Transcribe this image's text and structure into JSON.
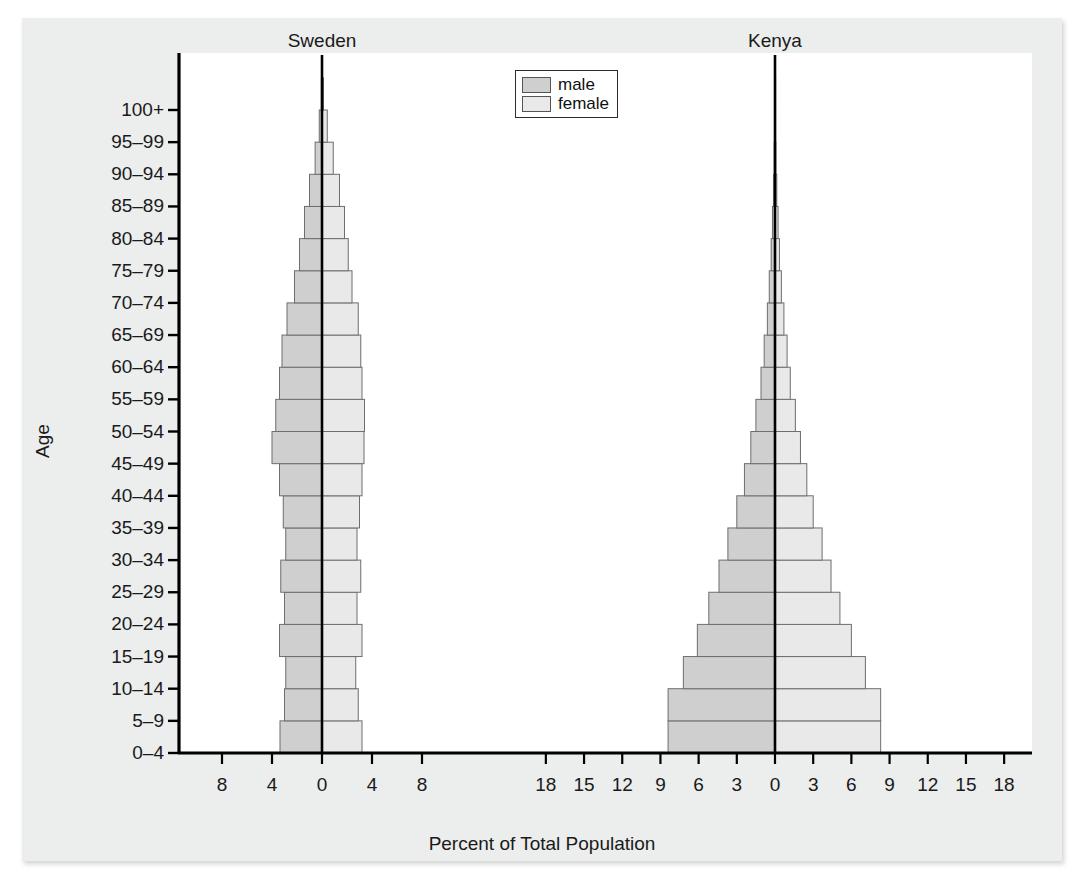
{
  "figure": {
    "background": "#eceded",
    "plot_background": "#ffffff"
  },
  "titles": {
    "left_panel": "Sweden",
    "right_panel": "Kenya"
  },
  "axes": {
    "y_title": "Age",
    "x_title": "Percent of Total Population",
    "y_tick_labels": [
      "0–4",
      "5–9",
      "10–14",
      "15–19",
      "20–24",
      "25–29",
      "30–34",
      "35–39",
      "40–44",
      "45–49",
      "50–54",
      "55–59",
      "60–64",
      "65–69",
      "70–74",
      "75–79",
      "80–84",
      "85–89",
      "90–94",
      "95–99",
      "100+"
    ],
    "sweden_x_ticks": [
      "8",
      "4",
      "0",
      "4",
      "8"
    ],
    "kenya_x_ticks": [
      "18",
      "15",
      "12",
      "9",
      "6",
      "3",
      "0",
      "3",
      "6",
      "9",
      "12",
      "15",
      "18"
    ]
  },
  "legend": {
    "position": "top-center",
    "items": [
      {
        "label": "male",
        "color": "#cfcfcf"
      },
      {
        "label": "female",
        "color": "#e9e9e9"
      }
    ]
  },
  "colors": {
    "male_fill": "#cfcfcf",
    "female_fill": "#e9e9e9",
    "bar_stroke": "#6e6e6e",
    "axis": "#000000",
    "text": "#1a1a1a"
  },
  "chart_data": {
    "type": "bar",
    "subtype": "population-pyramid",
    "title": "Percent of Total Population",
    "xlabel": "Percent of Total Population",
    "ylabel": "Age",
    "grid": false,
    "legend": [
      "male",
      "female"
    ],
    "categories": [
      "0–4",
      "5–9",
      "10–14",
      "15–19",
      "20–24",
      "25–29",
      "30–34",
      "35–39",
      "40–44",
      "45–49",
      "50–54",
      "55–59",
      "60–64",
      "65–69",
      "70–74",
      "75–79",
      "80–84",
      "85–89",
      "90–94",
      "95–99",
      "100+"
    ],
    "panels": [
      {
        "name": "Sweden",
        "xlim": [
          -10,
          10
        ],
        "xticks": [
          -8,
          -4,
          0,
          4,
          8
        ],
        "series": [
          {
            "name": "male",
            "values": [
              3.36,
              3.0,
              2.9,
              3.4,
              3.0,
              3.3,
              2.9,
              3.1,
              3.4,
              4.0,
              3.7,
              3.4,
              3.2,
              2.8,
              2.2,
              1.8,
              1.4,
              1.0,
              0.55,
              0.22,
              0.05
            ]
          },
          {
            "name": "female",
            "values": [
              3.2,
              2.9,
              2.7,
              3.2,
              2.8,
              3.1,
              2.8,
              3.0,
              3.2,
              3.36,
              3.4,
              3.2,
              3.1,
              2.9,
              2.4,
              2.1,
              1.8,
              1.4,
              0.9,
              0.42,
              0.12
            ]
          }
        ]
      },
      {
        "name": "Kenya",
        "xlim": [
          -20,
          20
        ],
        "xticks": [
          -18,
          -15,
          -12,
          -9,
          -6,
          -3,
          0,
          3,
          6,
          9,
          12,
          15,
          18
        ],
        "series": [
          {
            "name": "male",
            "values": [
              8.4,
              8.4,
              7.2,
              6.1,
              5.2,
              4.4,
              3.7,
              3.0,
              2.4,
              1.9,
              1.5,
              1.1,
              0.85,
              0.6,
              0.45,
              0.3,
              0.2,
              0.12,
              0.06,
              0.02,
              0.01
            ]
          },
          {
            "name": "female",
            "values": [
              8.3,
              8.3,
              7.1,
              6.0,
              5.1,
              4.4,
              3.7,
              3.0,
              2.5,
              2.0,
              1.6,
              1.2,
              0.95,
              0.7,
              0.5,
              0.35,
              0.24,
              0.14,
              0.07,
              0.03,
              0.01
            ]
          }
        ]
      }
    ]
  }
}
